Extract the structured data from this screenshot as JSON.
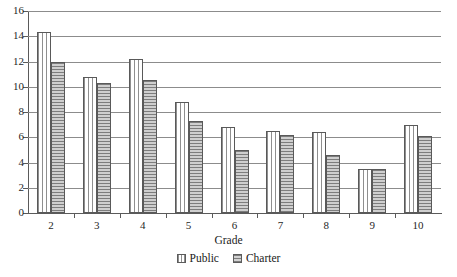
{
  "chart_data": {
    "type": "bar",
    "title": "",
    "subtitle": "",
    "xlabel": "Grade",
    "ylabel": "",
    "categories": [
      "2",
      "3",
      "4",
      "5",
      "6",
      "7",
      "8",
      "9",
      "10"
    ],
    "series": [
      {
        "name": "Public",
        "pattern": "vertical-stripes",
        "values": [
          14.3,
          10.8,
          12.2,
          8.8,
          6.8,
          6.5,
          6.4,
          3.5,
          7.0
        ]
      },
      {
        "name": "Charter",
        "pattern": "horizontal-stripes",
        "values": [
          12.0,
          10.3,
          10.5,
          7.3,
          5.0,
          6.2,
          4.6,
          3.5,
          6.1
        ]
      }
    ],
    "ylim": [
      0,
      16
    ],
    "yticks": [
      0,
      2,
      4,
      6,
      8,
      10,
      12,
      14,
      16
    ],
    "ytick_labels": [
      "0",
      "2",
      "4",
      "6",
      "8",
      "10",
      "12",
      "14",
      "16"
    ],
    "grid": true,
    "grid_axis": "y",
    "legend": [
      "Public",
      "Charter"
    ],
    "legend_position": "bottom-center"
  }
}
